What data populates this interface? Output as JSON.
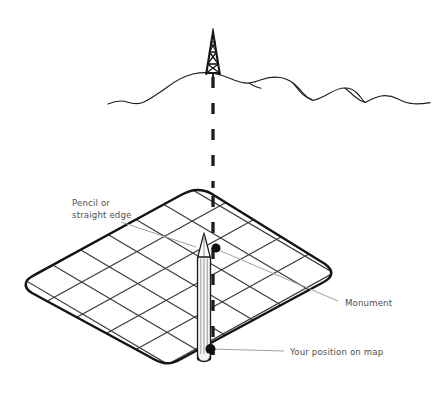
{
  "figure": {
    "type": "line-illustration",
    "width": 434,
    "height": 410,
    "background_color": "#ffffff"
  },
  "labels": {
    "pencil": {
      "line1": "Pencil or",
      "line2": "straight edge",
      "x": 72,
      "y": 206,
      "leader_to_x": 196,
      "leader_to_y": 246
    },
    "monument": {
      "text": "Monument",
      "x": 345,
      "y": 303,
      "leader_to_x": 214,
      "leader_to_y": 246
    },
    "position": {
      "text": "Your position on map",
      "x": 290,
      "y": 354,
      "leader_to_x": 209,
      "leader_to_y": 349
    }
  },
  "elements": {
    "monument_tower": {
      "name": "monument-tower",
      "description": "lattice observation tower on ridge summit",
      "apex_x": 213,
      "apex_y": 32,
      "base_y": 74
    },
    "ridge": {
      "name": "mountain-ridge-silhouette",
      "description": "distant mountain skyline profile"
    },
    "sight_line": {
      "name": "dashed-sight-line",
      "description": "vertical dashed line of sight from monument down to map",
      "x": 213,
      "y_top": 76,
      "y_bottom": 355,
      "dash_pattern": "11 14",
      "stroke_width": 3.2,
      "color": "#1c1c1c"
    },
    "map_sheet": {
      "name": "map-sheet",
      "description": "rounded rhombus map in perspective with grid lattice",
      "outline_color": "#151515",
      "grid_color": "#3a3a3a",
      "corners": {
        "top": [
          197,
          190
        ],
        "right": [
          330,
          272
        ],
        "bottom": [
          170,
          365
        ],
        "left": [
          26,
          283
        ]
      }
    },
    "pencil": {
      "name": "pencil",
      "description": "vertical pencil resting on map, tip pointing up",
      "x": 204,
      "tip_y": 233,
      "bottom_y": 360,
      "body_color": "#f2f2f2"
    },
    "monument_dot": {
      "name": "monument-map-dot",
      "x": 215,
      "y": 248,
      "radius": 4.4,
      "color": "#111111"
    },
    "position_dot": {
      "name": "your-position-dot",
      "x": 209,
      "y": 349,
      "radius": 4.8,
      "color": "#111111"
    }
  },
  "colors": {
    "ink": "#151515",
    "grid": "#3a3a3a",
    "text": "#4f4f4f",
    "leader": "#9a9a9a",
    "paper": "#ffffff"
  }
}
